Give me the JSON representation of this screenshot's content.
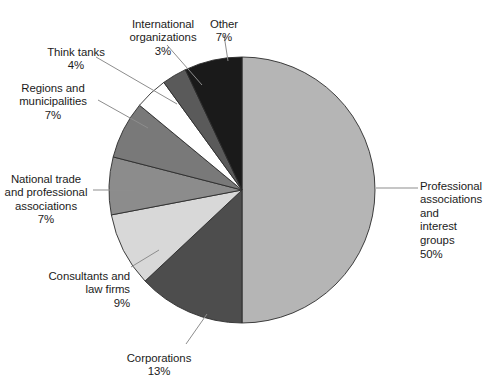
{
  "chart_data": {
    "type": "pie",
    "title": "",
    "subtitle": "",
    "xlabel": "",
    "ylabel": "",
    "legend_position": "none",
    "grid": false,
    "units": "percent",
    "start_angle_deg": 0,
    "direction": "clockwise",
    "categories": [
      "Professional associations and interest groups",
      "Corporations",
      "Consultants and law firms",
      "National trade and professional associations",
      "Regions and municipalities",
      "Think tanks",
      "International organizations",
      "Other"
    ],
    "values": [
      50,
      13,
      9,
      7,
      7,
      4,
      3,
      7
    ],
    "colors": [
      "#b5b5b5",
      "#4d4d4d",
      "#d8d8d8",
      "#8c8c8c",
      "#797979",
      "#ffffff",
      "#5a5a5a",
      "#1a1a1a"
    ],
    "slices": [
      {
        "key": "professional-associations",
        "name": "Professional associations and interest groups",
        "value": 50,
        "value_label": "50%",
        "color": "#b5b5b5",
        "label_lines": [
          "Professional",
          "associations and",
          "interest groups"
        ]
      },
      {
        "key": "corporations",
        "name": "Corporations",
        "value": 13,
        "value_label": "13%",
        "color": "#4d4d4d",
        "label_lines": [
          "Corporations"
        ]
      },
      {
        "key": "consultants-law-firms",
        "name": "Consultants and law firms",
        "value": 9,
        "value_label": "9%",
        "color": "#d8d8d8",
        "label_lines": [
          "Consultants and",
          "law firms"
        ]
      },
      {
        "key": "national-trade-associations",
        "name": "National trade and professional associations",
        "value": 7,
        "value_label": "7%",
        "color": "#8c8c8c",
        "label_lines": [
          "National trade",
          "and professional",
          "associations"
        ]
      },
      {
        "key": "regions-municipalities",
        "name": "Regions and municipalities",
        "value": 7,
        "value_label": "7%",
        "color": "#797979",
        "label_lines": [
          "Regions and",
          "municipalities"
        ]
      },
      {
        "key": "think-tanks",
        "name": "Think tanks",
        "value": 4,
        "value_label": "4%",
        "color": "#ffffff",
        "label_lines": [
          "Think tanks"
        ]
      },
      {
        "key": "international-organizations",
        "name": "International organizations",
        "value": 3,
        "value_label": "3%",
        "color": "#5a5a5a",
        "label_lines": [
          "International",
          "organizations"
        ]
      },
      {
        "key": "other",
        "name": "Other",
        "value": 7,
        "value_label": "7%",
        "color": "#1a1a1a",
        "label_lines": [
          "Other"
        ]
      }
    ]
  },
  "labels": {
    "professional_associations": "Professional\nassociations and\ninterest groups",
    "professional_associations_pct": "50%",
    "corporations": "Corporations",
    "corporations_pct": "13%",
    "consultants": "Consultants and\nlaw firms",
    "consultants_pct": "9%",
    "national_trade": "National trade\nand professional\nassociations",
    "national_trade_pct": "7%",
    "regions": "Regions and\nmunicipalities",
    "regions_pct": "7%",
    "think_tanks": "Think tanks",
    "think_tanks_pct": "4%",
    "international_orgs": "International\norganizations",
    "international_orgs_pct": "3%",
    "other": "Other",
    "other_pct": "7%"
  },
  "source_note": ""
}
